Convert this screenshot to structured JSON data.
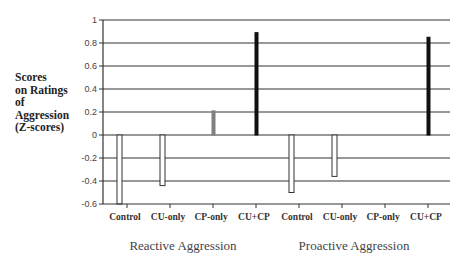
{
  "chart_data": {
    "type": "bar",
    "title": "",
    "ylabel": "Scores on Ratings of Aggression (Z-scores)",
    "ylabel_lines": [
      "Scores",
      "on Ratings",
      "of",
      "Aggression",
      "(Z-scores)"
    ],
    "xlabel": "",
    "ylim": [
      -0.6,
      1
    ],
    "yticks": [
      1,
      0.8,
      0.6,
      0.4,
      0.2,
      0,
      -0.2,
      -0.4,
      -0.6
    ],
    "ytick_labels": [
      "1",
      "0.8",
      "0.6",
      "0.4",
      "0.2",
      "0",
      "-0.2",
      "-0.4",
      "-0.6"
    ],
    "grid": true,
    "groups": [
      {
        "name": "Reactive Aggression",
        "categories": [
          "Control",
          "CU-only",
          "CP-only",
          "CU+CP"
        ],
        "values": [
          -0.6,
          -0.44,
          0.21,
          0.89
        ]
      },
      {
        "name": "Proactive Aggression",
        "categories": [
          "Control",
          "CU-only",
          "CP-only",
          "CU+CP"
        ],
        "values": [
          -0.5,
          -0.36,
          0.0,
          0.85
        ]
      }
    ],
    "bar_styles": {
      "Control": {
        "fill": "#ffffff",
        "stroke": "#333333"
      },
      "CU-only": {
        "fill": "#ffffff",
        "stroke": "#333333"
      },
      "CP-only": {
        "fill": "#808080",
        "stroke": "#808080"
      },
      "CU+CP": {
        "fill": "#111111",
        "stroke": "#111111"
      }
    },
    "legend": null
  }
}
